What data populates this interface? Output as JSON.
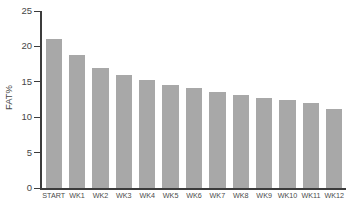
{
  "chart_data": {
    "type": "bar",
    "title": "",
    "xlabel": "",
    "ylabel": "FAT%",
    "ylim": [
      0,
      25
    ],
    "yticks": [
      0,
      5,
      10,
      15,
      20,
      25
    ],
    "grid": false,
    "legend": null,
    "bar_color": "#a8a8a8",
    "axis_color": "#3c3c3c",
    "background": "#ffffff",
    "categories": [
      "START",
      "WK1",
      "WK2",
      "WK3",
      "WK4",
      "WK5",
      "WK6",
      "WK7",
      "WK8",
      "WK9",
      "WK10",
      "WK11",
      "WK12"
    ],
    "values": [
      21.0,
      18.8,
      17.0,
      16.0,
      15.2,
      14.6,
      14.1,
      13.6,
      13.1,
      12.7,
      12.5,
      12.0,
      11.2
    ]
  }
}
